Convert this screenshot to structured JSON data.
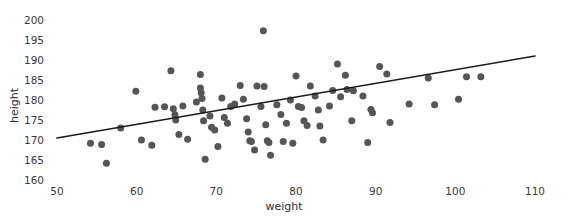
{
  "chart_data": {
    "type": "scatter",
    "title": "",
    "xlabel": "weight",
    "ylabel": "height",
    "xlim": [
      50,
      110
    ],
    "ylim": [
      160,
      200
    ],
    "xticks": [
      50,
      60,
      70,
      80,
      90,
      100,
      110
    ],
    "yticks": [
      160,
      165,
      170,
      175,
      180,
      185,
      190,
      195,
      200
    ],
    "grid": false,
    "legend": null,
    "marker": {
      "color": "#555555",
      "size_px": 7,
      "shape": "circle"
    },
    "trendline": {
      "type": "linear-fit",
      "color": "#1a1a1a",
      "width_px": 1.6,
      "x_start": 50,
      "y_start": 170.5,
      "x_end": 110,
      "y_end": 191.0
    },
    "points": [
      {
        "x": 54.2,
        "y": 169.2
      },
      {
        "x": 55.6,
        "y": 168.9
      },
      {
        "x": 56.2,
        "y": 164.2
      },
      {
        "x": 58.0,
        "y": 173.0
      },
      {
        "x": 59.9,
        "y": 182.2
      },
      {
        "x": 60.6,
        "y": 170.0
      },
      {
        "x": 61.9,
        "y": 168.7
      },
      {
        "x": 62.3,
        "y": 178.2
      },
      {
        "x": 63.5,
        "y": 178.3
      },
      {
        "x": 64.3,
        "y": 187.3
      },
      {
        "x": 64.6,
        "y": 177.8
      },
      {
        "x": 64.8,
        "y": 176.3
      },
      {
        "x": 64.9,
        "y": 175.0
      },
      {
        "x": 65.3,
        "y": 171.4
      },
      {
        "x": 65.8,
        "y": 178.5
      },
      {
        "x": 66.4,
        "y": 170.2
      },
      {
        "x": 67.5,
        "y": 179.5
      },
      {
        "x": 68.0,
        "y": 186.4
      },
      {
        "x": 68.0,
        "y": 183.0
      },
      {
        "x": 68.1,
        "y": 181.8
      },
      {
        "x": 68.2,
        "y": 180.4
      },
      {
        "x": 68.3,
        "y": 177.5
      },
      {
        "x": 68.4,
        "y": 174.8
      },
      {
        "x": 68.6,
        "y": 165.2
      },
      {
        "x": 69.2,
        "y": 176.0
      },
      {
        "x": 69.4,
        "y": 173.2
      },
      {
        "x": 69.8,
        "y": 172.5
      },
      {
        "x": 70.2,
        "y": 168.4
      },
      {
        "x": 70.7,
        "y": 180.5
      },
      {
        "x": 71.0,
        "y": 175.6
      },
      {
        "x": 71.4,
        "y": 174.2
      },
      {
        "x": 71.8,
        "y": 178.4
      },
      {
        "x": 72.3,
        "y": 179.0
      },
      {
        "x": 73.0,
        "y": 183.6
      },
      {
        "x": 73.4,
        "y": 180.2
      },
      {
        "x": 73.8,
        "y": 175.3
      },
      {
        "x": 74.0,
        "y": 172.0
      },
      {
        "x": 74.2,
        "y": 169.8
      },
      {
        "x": 74.4,
        "y": 169.6
      },
      {
        "x": 74.8,
        "y": 167.5
      },
      {
        "x": 75.1,
        "y": 183.5
      },
      {
        "x": 75.6,
        "y": 178.4
      },
      {
        "x": 75.9,
        "y": 197.3
      },
      {
        "x": 76.0,
        "y": 183.4
      },
      {
        "x": 76.2,
        "y": 173.8
      },
      {
        "x": 76.4,
        "y": 169.8
      },
      {
        "x": 76.6,
        "y": 169.4
      },
      {
        "x": 76.8,
        "y": 166.2
      },
      {
        "x": 77.6,
        "y": 178.8
      },
      {
        "x": 78.1,
        "y": 176.4
      },
      {
        "x": 78.4,
        "y": 169.6
      },
      {
        "x": 78.8,
        "y": 174.2
      },
      {
        "x": 79.3,
        "y": 180.0
      },
      {
        "x": 79.6,
        "y": 169.2
      },
      {
        "x": 80.0,
        "y": 186.0
      },
      {
        "x": 80.3,
        "y": 178.4
      },
      {
        "x": 80.7,
        "y": 178.1
      },
      {
        "x": 81.0,
        "y": 174.8
      },
      {
        "x": 81.4,
        "y": 173.6
      },
      {
        "x": 81.8,
        "y": 183.5
      },
      {
        "x": 82.4,
        "y": 181.0
      },
      {
        "x": 82.8,
        "y": 177.5
      },
      {
        "x": 83.0,
        "y": 173.5
      },
      {
        "x": 83.4,
        "y": 170.0
      },
      {
        "x": 84.2,
        "y": 178.5
      },
      {
        "x": 84.6,
        "y": 182.4
      },
      {
        "x": 85.2,
        "y": 189.0
      },
      {
        "x": 85.6,
        "y": 180.8
      },
      {
        "x": 86.2,
        "y": 186.2
      },
      {
        "x": 86.4,
        "y": 182.6
      },
      {
        "x": 87.0,
        "y": 174.8
      },
      {
        "x": 87.2,
        "y": 182.3
      },
      {
        "x": 88.4,
        "y": 181.0
      },
      {
        "x": 89.0,
        "y": 169.4
      },
      {
        "x": 89.4,
        "y": 177.6
      },
      {
        "x": 89.6,
        "y": 176.8
      },
      {
        "x": 90.5,
        "y": 188.4
      },
      {
        "x": 91.4,
        "y": 186.5
      },
      {
        "x": 91.8,
        "y": 174.4
      },
      {
        "x": 94.2,
        "y": 179.0
      },
      {
        "x": 96.6,
        "y": 185.5
      },
      {
        "x": 97.4,
        "y": 178.8
      },
      {
        "x": 100.4,
        "y": 180.2
      },
      {
        "x": 101.4,
        "y": 185.8
      },
      {
        "x": 103.2,
        "y": 185.8
      }
    ]
  },
  "axes": {
    "y_tick_labels": [
      "200",
      "195",
      "190",
      "185",
      "180",
      "175",
      "170",
      "165",
      "160"
    ],
    "x_tick_labels": [
      "50",
      "60",
      "70",
      "80",
      "90",
      "100",
      "110"
    ]
  }
}
